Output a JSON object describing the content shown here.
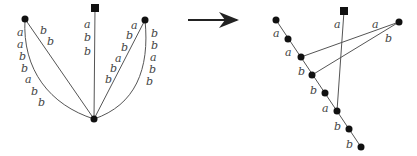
{
  "diagram": {
    "left_graph": {
      "nodes": {
        "square": {
          "x": 95,
          "y": 8,
          "shape": "square"
        },
        "left": {
          "x": 25,
          "y": 19,
          "shape": "circle"
        },
        "right": {
          "x": 145,
          "y": 20,
          "shape": "circle"
        },
        "bottom": {
          "x": 94,
          "y": 119,
          "shape": "circle"
        }
      },
      "edge_labels": {
        "left_curve": [
          "a",
          "a",
          "b",
          "b",
          "a",
          "b",
          "b"
        ],
        "left_straight": [
          "b",
          "b"
        ],
        "center_vertical": [
          "a",
          "b",
          "b"
        ],
        "right_straight": [
          "a",
          "b",
          "b",
          "a",
          "b",
          "b"
        ],
        "right_curve": [
          "b",
          "b",
          "a",
          "b",
          "b"
        ]
      }
    },
    "arrow": {
      "from_x": 188,
      "to_x": 238,
      "y": 20
    },
    "right_graph": {
      "square": {
        "x": 344,
        "y": 11
      },
      "right_node": {
        "x": 399,
        "y": 22
      },
      "chain_nodes": [
        {
          "x": 276,
          "y": 20
        },
        {
          "x": 288,
          "y": 39
        },
        {
          "x": 301,
          "y": 57
        },
        {
          "x": 312,
          "y": 75
        },
        {
          "x": 325,
          "y": 93
        },
        {
          "x": 337,
          "y": 111
        },
        {
          "x": 349,
          "y": 129
        },
        {
          "x": 361,
          "y": 147
        }
      ],
      "chain_labels": [
        "a",
        "a",
        "b",
        "b",
        "a",
        "b",
        "b"
      ],
      "square_edge_label": "a",
      "right_edge_labels": [
        "a",
        "b"
      ]
    }
  }
}
